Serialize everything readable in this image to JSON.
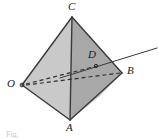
{
  "figure": {
    "caption": "Fig.",
    "background_color": "#ffffff",
    "stroke_color": "#3a3a3a",
    "label_color": "#1a1a1a",
    "faces": [
      {
        "name": "face-O-C-A",
        "label": "left front face",
        "fill": "#c8c8c8",
        "points": "22,85 72,17 70,120"
      },
      {
        "name": "face-C-B-A",
        "label": "right upper face",
        "fill": "#a9a9a9",
        "points": "72,17 122,73 70,120"
      },
      {
        "name": "face-O-C-B",
        "label": "top back face",
        "fill": "#bdbdbd",
        "points": "22,85 72,17 122,73"
      },
      {
        "name": "face-A-B-lower",
        "label": "lower right face",
        "fill": "#8f8f8f",
        "points": "70,120 122,73 118,76"
      }
    ],
    "vertices": [
      {
        "id": "C",
        "label": "C",
        "x": 72,
        "y": 17,
        "label_x": 68,
        "label_y": 2,
        "dot": false
      },
      {
        "id": "O",
        "label": "O",
        "x": 22,
        "y": 85,
        "label_x": 8,
        "label_y": 79,
        "dot": true
      },
      {
        "id": "B",
        "label": "B",
        "x": 122,
        "y": 73,
        "label_x": 128,
        "label_y": 66,
        "dot": false
      },
      {
        "id": "A",
        "label": "A",
        "x": 70,
        "y": 120,
        "label_x": 66,
        "label_y": 122,
        "dot": false
      },
      {
        "id": "D",
        "label": "D",
        "x": 96,
        "y": 66,
        "label_x": 88,
        "label_y": 49,
        "dot": true
      }
    ],
    "solid_edges": [
      {
        "name": "edge-O-C",
        "x1": 22,
        "y1": 85,
        "x2": 72,
        "y2": 17
      },
      {
        "name": "edge-C-B",
        "x1": 72,
        "y1": 17,
        "x2": 122,
        "y2": 73
      },
      {
        "name": "edge-O-A",
        "x1": 22,
        "y1": 85,
        "x2": 70,
        "y2": 120
      },
      {
        "name": "edge-A-B",
        "x1": 70,
        "y1": 120,
        "x2": 122,
        "y2": 73
      },
      {
        "name": "edge-C-A",
        "x1": 72,
        "y1": 17,
        "x2": 70,
        "y2": 120
      }
    ],
    "dashed_edges": [
      {
        "name": "hidden-edge-O-B",
        "x1": 25,
        "y1": 85,
        "x2": 122,
        "y2": 73
      },
      {
        "name": "hidden-edge-O-D",
        "x1": 25,
        "y1": 84,
        "x2": 96,
        "y2": 66
      }
    ],
    "ray": {
      "name": "transversal-ray",
      "x1": 60,
      "y1": 78,
      "x2": 157,
      "y2": 48
    }
  }
}
